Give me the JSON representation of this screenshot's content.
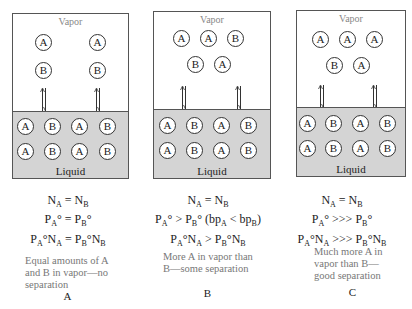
{
  "labels": {
    "vapor": "Vapor",
    "liquid": "Liquid"
  },
  "panels": [
    {
      "id": "A",
      "letter": "A",
      "vapor_molecules": [
        {
          "label": "A",
          "x": 22,
          "y": 20
        },
        {
          "label": "A",
          "x": 76,
          "y": 20
        },
        {
          "label": "B",
          "x": 22,
          "y": 48
        },
        {
          "label": "B",
          "x": 76,
          "y": 48
        }
      ],
      "liquid_rows": [
        [
          "A",
          "B",
          "A",
          "B"
        ],
        [
          "A",
          "B",
          "A",
          "B"
        ]
      ],
      "equations": [
        {
          "lhs": "N",
          "lsub": "A",
          "lsup": "",
          "op": "=",
          "rhs": "N",
          "rsub": "B",
          "rsup": "",
          "extra": ""
        },
        {
          "lhs": "P",
          "lsub": "A",
          "lsup": "°",
          "op": "=",
          "rhs": "P",
          "rsub": "B",
          "rsup": "°",
          "extra": ""
        },
        {
          "lhs": "P",
          "lsub": "A",
          "lsup": "°N",
          "lsub2": "A",
          "op": "=",
          "rhs": "P",
          "rsub": "B",
          "rsup": "°N",
          "rsub2": "B",
          "extra": ""
        }
      ],
      "description": "Equal amounts of A and B in vapor—no separation"
    },
    {
      "id": "B",
      "letter": "B",
      "vapor_molecules": [
        {
          "label": "A",
          "x": 19,
          "y": 18
        },
        {
          "label": "A",
          "x": 46,
          "y": 18
        },
        {
          "label": "B",
          "x": 73,
          "y": 18
        },
        {
          "label": "B",
          "x": 33,
          "y": 44
        },
        {
          "label": "A",
          "x": 60,
          "y": 44
        }
      ],
      "liquid_rows": [
        [
          "A",
          "B",
          "A",
          "B"
        ],
        [
          "A",
          "B",
          "A",
          "B"
        ]
      ],
      "equations": [
        {
          "lhs": "N",
          "lsub": "A",
          "lsup": "",
          "op": "=",
          "rhs": "N",
          "rsub": "B",
          "rsup": "",
          "extra": ""
        },
        {
          "lhs": "P",
          "lsub": "A",
          "lsup": "°",
          "op": ">",
          "rhs": "P",
          "rsub": "B",
          "rsup": "°",
          "extra": "(bp_A < bp_B)"
        },
        {
          "lhs": "P",
          "lsub": "A",
          "lsup": "°N",
          "lsub2": "A",
          "op": ">",
          "rhs": "P",
          "rsub": "B",
          "rsup": "°N",
          "rsub2": "B",
          "extra": ""
        }
      ],
      "description": "More A in vapor than B—some separation"
    },
    {
      "id": "C",
      "letter": "C",
      "vapor_molecules": [
        {
          "label": "A",
          "x": 15,
          "y": 20
        },
        {
          "label": "A",
          "x": 42,
          "y": 20
        },
        {
          "label": "A",
          "x": 69,
          "y": 20
        },
        {
          "label": "B",
          "x": 29,
          "y": 46
        },
        {
          "label": "A",
          "x": 56,
          "y": 46
        }
      ],
      "liquid_rows": [
        [
          "A",
          "B",
          "A",
          "B"
        ],
        [
          "A",
          "B",
          "A",
          "B"
        ]
      ],
      "equations": [
        {
          "lhs": "N",
          "lsub": "A",
          "lsup": "",
          "op": "=",
          "rhs": "N",
          "rsub": "B",
          "rsup": "",
          "extra": ""
        },
        {
          "lhs": "P",
          "lsub": "A",
          "lsup": "°",
          "op": ">>>",
          "rhs": "P",
          "rsub": "B",
          "rsup": "°",
          "extra": ""
        },
        {
          "lhs": "P",
          "lsub": "A",
          "lsup": "°N",
          "lsub2": "A",
          "op": ">>>",
          "rhs": "P",
          "rsub": "B",
          "rsup": "°N",
          "rsub2": "B",
          "extra": ""
        }
      ],
      "description": "Much more A in vapor than B—good separation"
    }
  ],
  "text": {
    "A": {
      "eq1": [
        "N",
        "A",
        "=",
        "N",
        "B"
      ],
      "eq2": [
        "P",
        "A",
        "°",
        "=",
        "P",
        "B",
        "°"
      ],
      "eq3": [
        "P",
        "A",
        "°N",
        "A",
        "=",
        "P",
        "B",
        "°N",
        "B"
      ],
      "desc_lines": [
        "Equal amounts of A",
        "and B in vapor—no",
        "separation"
      ],
      "letter": "A"
    },
    "B": {
      "eq1": [
        "N",
        "A",
        "=",
        "N",
        "B"
      ],
      "eq2": [
        "P",
        "A",
        "°",
        "&gt;",
        "P",
        "B",
        "°",
        "(bp",
        "A",
        "&lt;",
        "bp",
        "B",
        ")"
      ],
      "eq3": [
        "P",
        "A",
        "°N",
        "A",
        "&gt;",
        "P",
        "B",
        "°N",
        "B"
      ],
      "desc_lines": [
        "More A in vapor than",
        "B—some separation"
      ],
      "letter": "B"
    },
    "C": {
      "eq1": [
        "N",
        "A",
        "=",
        "N",
        "B"
      ],
      "eq2": [
        "P",
        "A",
        "°",
        "&gt;&gt;&gt;",
        "P",
        "B",
        "°"
      ],
      "eq3": [
        "P",
        "A",
        "°N",
        "A",
        "&gt;&gt;&gt;",
        "P",
        "B",
        "°N",
        "B"
      ],
      "desc_lines": [
        "Much more A in",
        "vapor than B—",
        "good separation"
      ],
      "letter": "C"
    }
  },
  "colors": {
    "liquid_fill": "#d4d4d4",
    "border": "#555555",
    "vapor_text": "#888888",
    "description_text": "#777777"
  }
}
